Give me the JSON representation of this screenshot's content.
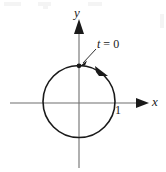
{
  "figure": {
    "background_color": "#ffffff",
    "ink_color": "#1a1a1a",
    "axis_color": "#6b6b6b"
  },
  "axes": {
    "x_label": "x",
    "y_label": "y",
    "origin": {
      "x": 79,
      "y": 103
    },
    "x_axis": {
      "start_x": 10,
      "end_x": 148,
      "y": 103
    },
    "y_axis": {
      "x": 79,
      "start_y": 20,
      "end_y": 168
    }
  },
  "ticks": [
    {
      "name": "x-tick-one",
      "label": "1",
      "x": 115,
      "y": 104
    }
  ],
  "curve": {
    "type": "circle",
    "center": {
      "x": 79,
      "y": 101.5
    },
    "radius": 36,
    "stroke_width": 1.6
  },
  "annotations": {
    "start_point": {
      "label_variable": "t",
      "label_equals": "=",
      "label_value": "0",
      "label_text": "t = 0",
      "point": {
        "x": 79,
        "y": 66
      }
    },
    "direction": {
      "sense": "clockwise",
      "arrow_at": {
        "x": 103,
        "y": 73
      }
    }
  }
}
